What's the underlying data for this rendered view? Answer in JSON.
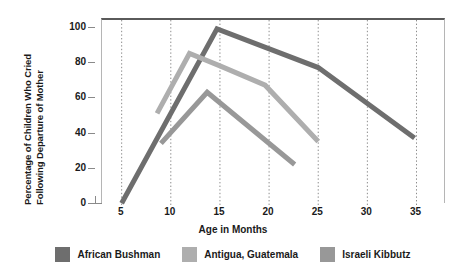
{
  "chart_data": {
    "type": "line",
    "title": "",
    "xlabel": "Age in Months",
    "ylabel": "Percentage of Children Who Cried Following Departure of Mother",
    "ylabel_line1": "Percentage of Children Who Cried",
    "ylabel_line2": "Following Departure of Mother",
    "xlim": [
      3,
      38
    ],
    "ylim": [
      0,
      105
    ],
    "xticks": [
      5,
      10,
      15,
      20,
      25,
      30,
      35
    ],
    "yticks": [
      0,
      20,
      40,
      60,
      80,
      100
    ],
    "xtick_labels": [
      "5",
      "10",
      "15",
      "20",
      "25",
      "30",
      "35"
    ],
    "ytick_labels": [
      "0",
      "20",
      "40",
      "60",
      "80",
      "100"
    ],
    "grid": "vertical-dotted",
    "legend_position": "below",
    "series": [
      {
        "name": "African Bushman",
        "color": "#6e6e6e",
        "points": [
          {
            "x": 5,
            "y": 1
          },
          {
            "x": 14.7,
            "y": 100
          },
          {
            "x": 25,
            "y": 78
          },
          {
            "x": 34.8,
            "y": 38
          }
        ]
      },
      {
        "name": "Antigua, Guatemala",
        "color": "#aeaeae",
        "points": [
          {
            "x": 8.6,
            "y": 52
          },
          {
            "x": 11.9,
            "y": 86
          },
          {
            "x": 15,
            "y": 79
          },
          {
            "x": 19.6,
            "y": 68
          },
          {
            "x": 25,
            "y": 36
          }
        ]
      },
      {
        "name": "Israeli Kibbutz",
        "color": "#989898",
        "points": [
          {
            "x": 9,
            "y": 35
          },
          {
            "x": 13.7,
            "y": 64
          },
          {
            "x": 22.6,
            "y": 23
          }
        ]
      }
    ]
  },
  "legend": {
    "items": [
      {
        "label": "African Bushman",
        "color": "#6e6e6e"
      },
      {
        "label": "Antigua, Guatemala",
        "color": "#aeaeae"
      },
      {
        "label": "Israeli Kibbutz",
        "color": "#989898"
      }
    ]
  }
}
